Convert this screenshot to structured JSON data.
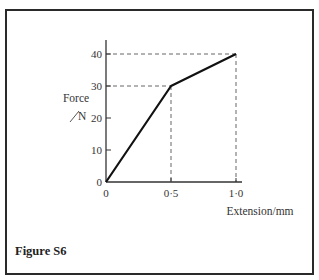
{
  "caption": "Figure S6",
  "chart_data": {
    "type": "line",
    "title": "",
    "xlabel": "Extension/mm",
    "ylabel_line1": "Force",
    "ylabel_line2": "N",
    "xlim": [
      0,
      1.0
    ],
    "ylim": [
      0,
      40
    ],
    "x_ticks": [
      {
        "value": 0.5,
        "label": "0·5"
      },
      {
        "value": 1.0,
        "label": "1·0"
      }
    ],
    "x_origin_label": "0",
    "y_ticks": [
      {
        "value": 0,
        "label": "0"
      },
      {
        "value": 10,
        "label": "10"
      },
      {
        "value": 20,
        "label": "20"
      },
      {
        "value": 30,
        "label": "30"
      },
      {
        "value": 40,
        "label": "40"
      }
    ],
    "series": [
      {
        "name": "force-extension",
        "x": [
          0,
          0.5,
          1.0
        ],
        "y": [
          0,
          30,
          40
        ]
      }
    ],
    "guides": [
      {
        "x": 0.5,
        "y": 30
      },
      {
        "x": 1.0,
        "y": 40
      }
    ],
    "grid": false,
    "legend": "none"
  }
}
